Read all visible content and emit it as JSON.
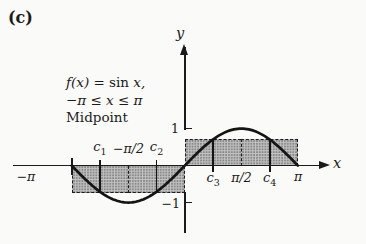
{
  "figure": {
    "panel_label": "(c)",
    "annotation": {
      "line1_fx": "f(x) = ",
      "line1_fn": "sin ",
      "line1_var": "x,",
      "line2": "−π ≤ x ≤ π",
      "line3": "Midpoint"
    },
    "axis_labels": {
      "x": "x",
      "y": "y"
    },
    "y_tick_labels": {
      "one": "1",
      "neg_one": "−1"
    },
    "x_tick_labels": {
      "neg_pi": "−π",
      "neg_half_pi": "−π/2",
      "half_pi": "π/2",
      "pi": "π"
    }
  },
  "chart_data": {
    "type": "line",
    "function": "sin(x)",
    "x_range": [
      -3.14159265,
      3.14159265
    ],
    "xlabel": "x",
    "ylabel": "y",
    "y_ticks": [
      -1,
      1
    ],
    "x_ticks_labeled": [
      "−π",
      "−π/2",
      "π/2",
      "π"
    ],
    "key_points": [
      [
        -3.1416,
        0
      ],
      [
        -1.5708,
        -1
      ],
      [
        0,
        0
      ],
      [
        1.5708,
        1
      ],
      [
        3.1416,
        0
      ]
    ],
    "riemann": {
      "method": "Midpoint",
      "n": 4,
      "dx": 1.5708,
      "rectangles": [
        {
          "interval": [
            -3.14159265,
            -1.57079633
          ],
          "midpoint": -2.35619449,
          "midpoint_label": "c1",
          "height": -0.70710678
        },
        {
          "interval": [
            -1.57079633,
            0
          ],
          "midpoint": -0.78539816,
          "midpoint_label": "c2",
          "height": -0.70710678
        },
        {
          "interval": [
            0,
            1.57079633
          ],
          "midpoint": 0.78539816,
          "midpoint_label": "c3",
          "height": 0.70710678
        },
        {
          "interval": [
            1.57079633,
            3.14159265
          ],
          "midpoint": 2.35619449,
          "midpoint_label": "c4",
          "height": 0.70710678
        }
      ]
    }
  }
}
